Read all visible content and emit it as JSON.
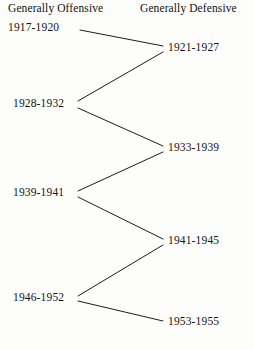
{
  "chart_data": {
    "type": "diagram",
    "title": "",
    "subtitle": "",
    "xlabel": "",
    "ylabel": "",
    "grid": false,
    "legend_position": "none",
    "columns": [
      {
        "id": "offensive",
        "label": "Generally Offensive"
      },
      {
        "id": "defensive",
        "label": "Generally Defensive"
      }
    ],
    "nodes": [
      {
        "id": "n1",
        "column": "offensive",
        "label": "1917-1920",
        "x": 8,
        "y": 28
      },
      {
        "id": "n2",
        "column": "defensive",
        "label": "1921-1927",
        "x": 168,
        "y": 48
      },
      {
        "id": "n3",
        "column": "offensive",
        "label": "1928-1932",
        "x": 13,
        "y": 104
      },
      {
        "id": "n4",
        "column": "defensive",
        "label": "1933-1939",
        "x": 168,
        "y": 148
      },
      {
        "id": "n5",
        "column": "offensive",
        "label": "1939-1941",
        "x": 13,
        "y": 193
      },
      {
        "id": "n6",
        "column": "defensive",
        "label": "1941-1945",
        "x": 168,
        "y": 241
      },
      {
        "id": "n7",
        "column": "offensive",
        "label": "1946-1952",
        "x": 13,
        "y": 298
      },
      {
        "id": "n8",
        "column": "defensive",
        "label": "1953-1955",
        "x": 168,
        "y": 322
      }
    ],
    "edges": [
      {
        "from": "n1",
        "to": "n2",
        "x1": 80,
        "y1": 30,
        "x2": 163,
        "y2": 46
      },
      {
        "from": "n2",
        "to": "n3",
        "x1": 163,
        "y1": 52,
        "x2": 78,
        "y2": 101
      },
      {
        "from": "n3",
        "to": "n4",
        "x1": 78,
        "y1": 108,
        "x2": 163,
        "y2": 146
      },
      {
        "from": "n4",
        "to": "n5",
        "x1": 163,
        "y1": 152,
        "x2": 78,
        "y2": 191
      },
      {
        "from": "n5",
        "to": "n6",
        "x1": 78,
        "y1": 197,
        "x2": 163,
        "y2": 239
      },
      {
        "from": "n6",
        "to": "n7",
        "x1": 163,
        "y1": 245,
        "x2": 78,
        "y2": 296
      },
      {
        "from": "n7",
        "to": "n8",
        "x1": 78,
        "y1": 301,
        "x2": 163,
        "y2": 321
      }
    ],
    "colors": {
      "background": "#fdfdfc",
      "text": "#141414",
      "line": "#1d1d1d"
    }
  }
}
